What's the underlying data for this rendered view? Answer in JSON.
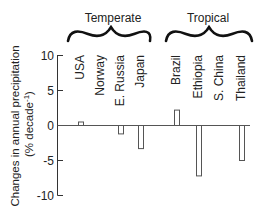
{
  "chart_data": {
    "type": "bar",
    "title": "",
    "xlabel": "",
    "ylabel": "Changes in annual precipitation",
    "ylabel_units": "(% decade⁻¹)",
    "ylim": [
      -10,
      10
    ],
    "yticks": [
      10,
      5,
      0,
      -5,
      -10
    ],
    "grid": false,
    "legend": null,
    "groups": [
      {
        "name": "Temperate",
        "categories": [
          "USA",
          "Norway",
          "E. Russia",
          "Japan"
        ]
      },
      {
        "name": "Tropical",
        "categories": [
          "Brazil",
          "Ethiopia",
          "S. China",
          "Thailand"
        ]
      }
    ],
    "categories": [
      "USA",
      "Norway",
      "E. Russia",
      "Japan",
      "Brazil",
      "Ethiopia",
      "S. China",
      "Thailand"
    ],
    "values": [
      0.5,
      0,
      -1.2,
      -3.3,
      2.2,
      -7.2,
      0,
      -5.0
    ],
    "bar_style": "hollow outlined bars"
  },
  "labels": {
    "ylabel_line1": "Changes in annual precipitation",
    "ylabel_line2": "(% decade",
    "ylabel_sup": "-1",
    "ylabel_close": ")",
    "group_temperate": "Temperate",
    "group_tropical": "Tropical",
    "cat_0": "USA",
    "cat_1": "Norway",
    "cat_2": "E. Russia",
    "cat_3": "Japan",
    "cat_4": "Brazil",
    "cat_5": "Ethiopia",
    "cat_6": "S. China",
    "cat_7": "Thailand",
    "tick_10": "10",
    "tick_5": "5",
    "tick_0": "0",
    "tick_m5": "-5",
    "tick_m10": "-10"
  }
}
